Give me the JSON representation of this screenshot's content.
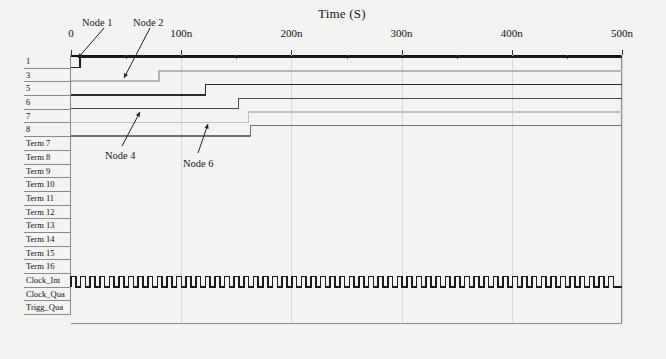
{
  "chart_data": {
    "type": "line",
    "title": "Time (S)",
    "xlabel": "Time (S)",
    "ylabel": "",
    "xlim": [
      0,
      500
    ],
    "x_unit": "n",
    "grid": true,
    "legend": "none",
    "tick_labels": [
      "0",
      "100n",
      "200n",
      "300n",
      "400n",
      "500n"
    ],
    "tick_values": [
      0,
      100,
      200,
      300,
      400,
      500
    ],
    "minor_tick_values": [
      50,
      150,
      250,
      350,
      450
    ],
    "signals": [
      {
        "name": "1",
        "rise_time": 8,
        "color": "#1c1c1c",
        "width": 1.9,
        "has_wave": true,
        "type": "step"
      },
      {
        "name": "3",
        "rise_time": 80,
        "color": "#b5b5b5",
        "width": 1.5,
        "has_wave": true,
        "type": "step"
      },
      {
        "name": "5",
        "rise_time": 122,
        "color": "#2b2b2b",
        "width": 1.7,
        "has_wave": true,
        "type": "step"
      },
      {
        "name": "6",
        "rise_time": 152,
        "color": "#4a4a4a",
        "width": 1.6,
        "has_wave": true,
        "type": "step"
      },
      {
        "name": "7",
        "rise_time": 161,
        "color": "#c0c0c0",
        "width": 1.5,
        "has_wave": true,
        "type": "step"
      },
      {
        "name": "8",
        "rise_time": 163,
        "color": "#707070",
        "width": 1.5,
        "has_wave": true,
        "type": "step"
      },
      {
        "name": "Term 7",
        "color": "#555555",
        "width": 1.0,
        "has_wave": false,
        "type": "flat"
      },
      {
        "name": "Term 8",
        "color": "#555555",
        "width": 1.0,
        "has_wave": false,
        "type": "flat"
      },
      {
        "name": "Term 9",
        "color": "#555555",
        "width": 1.0,
        "has_wave": false,
        "type": "flat"
      },
      {
        "name": "Term 10",
        "color": "#555555",
        "width": 1.0,
        "has_wave": false,
        "type": "flat"
      },
      {
        "name": "Term 11",
        "color": "#555555",
        "width": 1.0,
        "has_wave": false,
        "type": "flat"
      },
      {
        "name": "Term 12",
        "color": "#555555",
        "width": 1.0,
        "has_wave": false,
        "type": "flat"
      },
      {
        "name": "Term 13",
        "color": "#555555",
        "width": 1.0,
        "has_wave": false,
        "type": "flat"
      },
      {
        "name": "Term 14",
        "color": "#555555",
        "width": 1.0,
        "has_wave": false,
        "type": "flat"
      },
      {
        "name": "Term 15",
        "color": "#555555",
        "width": 1.0,
        "has_wave": false,
        "type": "flat"
      },
      {
        "name": "Term 16",
        "color": "#555555",
        "width": 1.0,
        "has_wave": false,
        "type": "flat"
      },
      {
        "name": "Clock_Int",
        "color": "#1c1c1c",
        "width": 1.6,
        "has_wave": true,
        "type": "clock",
        "period": 9.6,
        "duty": 0.5,
        "cycles": 57
      },
      {
        "name": "Clock_Qua",
        "color": "#555555",
        "width": 1.0,
        "has_wave": false,
        "type": "flat"
      },
      {
        "name": "Trigg_Qua",
        "color": "#555555",
        "width": 1.0,
        "has_wave": false,
        "type": "flat"
      }
    ],
    "annotations": [
      {
        "text": "Node 1",
        "label_x": 82,
        "label_y": 17,
        "tip_x": 78,
        "tip_y": 58,
        "tail_x": 104,
        "tail_y": 28
      },
      {
        "text": "Node 2",
        "label_x": 133,
        "label_y": 17,
        "tip_x": 124,
        "tip_y": 78,
        "tail_x": 150,
        "tail_y": 28
      },
      {
        "text": "Node 4",
        "label_x": 105,
        "label_y": 150,
        "tip_x": 140,
        "tip_y": 112,
        "tail_x": 122,
        "tail_y": 146
      },
      {
        "text": "Node 6",
        "label_x": 183,
        "label_y": 158,
        "tip_x": 208,
        "tip_y": 124,
        "tail_x": 198,
        "tail_y": 153
      }
    ]
  },
  "colors": {
    "page_background": "#f3f3f1",
    "plot_background": "#ffffff",
    "axis": "#111111",
    "grid": "#d8d8d8",
    "border": "#8a8a8a",
    "text": "#1a1a1a"
  }
}
